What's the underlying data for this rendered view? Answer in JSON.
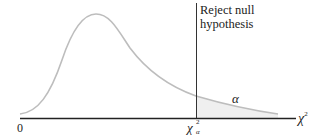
{
  "diagram": {
    "region_label_line1": "Reject null",
    "region_label_line2": "hypothesis",
    "origin_label": "0",
    "critical_value_label": "χ",
    "critical_value_sup": "2",
    "critical_value_sub": "α",
    "x_axis_label": "χ",
    "x_axis_sup": "2",
    "tail_area_label": "α",
    "colors": {
      "curve": "#bdbdbd",
      "axis": "#222222",
      "tail_fill": "#efefef",
      "critical_line": "#333333"
    }
  }
}
